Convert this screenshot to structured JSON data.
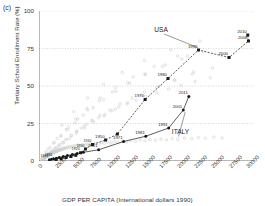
{
  "panel": {
    "tag": "(c)"
  },
  "chart_data": {
    "type": "scatter",
    "title": "",
    "xlabel": "GDP PER CAPITA (International dollars 1990)",
    "ylabel": "Tertiary School Enrollment Rate (%)",
    "xlim": [
      0,
      31000
    ],
    "ylim": [
      0,
      100
    ],
    "xticks": [
      0,
      2500,
      5000,
      7500,
      10000,
      12500,
      15000,
      17500,
      20000,
      22500,
      25000,
      27500,
      30000
    ],
    "yticks": [
      0,
      25,
      50,
      75,
      100
    ],
    "grid": "horizontal-dotted",
    "legend": "none",
    "annotations": [
      {
        "text": "USA",
        "x": 17600,
        "y": 86
      },
      {
        "text": "ITALY",
        "x": 20400,
        "y": 18
      }
    ],
    "background_points": {
      "name": "All countries (background scatter)",
      "marker": "open-circle",
      "color": "#c9c9c9",
      "x": [
        300,
        420,
        520,
        600,
        660,
        700,
        760,
        820,
        880,
        920,
        980,
        1020,
        1080,
        1140,
        1200,
        1260,
        1320,
        1380,
        1440,
        1500,
        1560,
        1620,
        1700,
        1760,
        1820,
        1900,
        1980,
        2050,
        2120,
        2200,
        2280,
        2360,
        2450,
        2540,
        2620,
        2700,
        2800,
        2900,
        3000,
        3100,
        3200,
        3300,
        3420,
        3520,
        3650,
        3800,
        3950,
        4100,
        4250,
        4400,
        4600,
        4800,
        5000,
        5200,
        5400,
        5600,
        5900,
        6200,
        6500,
        6800,
        7100,
        7400,
        7800,
        8200,
        8600,
        9000,
        9400,
        9900,
        10400,
        10900,
        11400,
        12000,
        12600,
        13200,
        13900,
        14600,
        15300,
        16000,
        16800,
        17600,
        18400,
        19200,
        20000,
        21000,
        22000,
        23000,
        24000,
        25200,
        26400,
        800,
        1100,
        1500,
        1900,
        2400,
        2900,
        3400,
        4000,
        4700,
        5400,
        6100,
        6900,
        7700,
        8600,
        9500,
        10500,
        11500,
        12700,
        14000,
        15400,
        17000,
        18700,
        20500,
        22500,
        24700,
        1200,
        1700,
        2300,
        3000,
        3800,
        4600,
        5500,
        6500,
        7600,
        8800,
        10200,
        11700,
        13400,
        15200,
        17300,
        19600,
        22100,
        25000,
        900,
        1400,
        2000,
        2700,
        3500,
        4400,
        5400,
        6600,
        7900,
        9400,
        11000,
        12800,
        14800,
        17000,
        19500,
        22300,
        1000,
        1600,
        2200,
        3100,
        4100,
        5200,
        6400,
        7800,
        9300,
        11100,
        13100,
        15300,
        17800,
        20600,
        23700,
        1300,
        2100,
        3200,
        4300,
        5600,
        7000,
        8700,
        10600,
        12800,
        15300,
        18200,
        21400,
        2600,
        3900,
        5300,
        6900,
        8800,
        11000,
        13600,
        16600,
        20000,
        3300,
        5000,
        7000,
        9300,
        12000,
        15200,
        19000,
        23200
      ],
      "y": [
        1.2,
        1.5,
        1.1,
        2.0,
        1.4,
        2.3,
        1.8,
        2.6,
        2.1,
        3.0,
        2.4,
        3.3,
        2.8,
        3.6,
        3.1,
        4.0,
        3.4,
        4.3,
        3.8,
        4.6,
        4.1,
        5.0,
        4.4,
        5.3,
        4.8,
        5.6,
        5.1,
        6.0,
        5.4,
        6.3,
        5.8,
        6.6,
        6.1,
        7.0,
        6.4,
        7.3,
        6.8,
        7.6,
        7.1,
        8.0,
        7.4,
        8.3,
        7.8,
        8.6,
        8.1,
        9.0,
        8.4,
        9.3,
        8.8,
        9.6,
        9.1,
        10.0,
        9.4,
        10.3,
        9.8,
        10.6,
        10.1,
        11.0,
        10.4,
        11.3,
        10.8,
        11.6,
        11.1,
        12.0,
        11.4,
        12.3,
        11.8,
        12.6,
        12.1,
        13.0,
        12.4,
        13.3,
        12.8,
        13.6,
        13.1,
        14.0,
        13.4,
        14.3,
        13.8,
        14.6,
        14.1,
        15.0,
        14.4,
        15.3,
        14.8,
        15.6,
        15.1,
        16.0,
        15.4,
        2.5,
        3.5,
        5.0,
        6.5,
        8.5,
        10.5,
        12.5,
        14.5,
        17.0,
        19.5,
        22.0,
        24.5,
        27.0,
        29.0,
        31.0,
        33.5,
        36.0,
        38.0,
        40.5,
        43.0,
        45.5,
        48.0,
        50.5,
        53.0,
        55.5,
        4.0,
        6.0,
        8.5,
        11.0,
        14.0,
        17.0,
        20.0,
        23.5,
        27.0,
        30.5,
        34.0,
        38.0,
        42.0,
        46.0,
        50.0,
        54.0,
        58.0,
        62.0,
        3.0,
        5.0,
        7.0,
        9.5,
        12.0,
        15.0,
        18.5,
        22.0,
        26.0,
        30.0,
        34.5,
        39.0,
        44.0,
        49.0,
        54.0,
        59.5,
        6.0,
        9.0,
        12.5,
        16.5,
        21.0,
        25.5,
        30.5,
        35.5,
        41.0,
        46.5,
        52.0,
        57.5,
        63.0,
        68.0,
        73.0,
        8.0,
        12.0,
        17.0,
        22.5,
        28.0,
        34.0,
        40.0,
        46.0,
        52.0,
        58.0,
        64.0,
        70.0,
        15.0,
        21.0,
        28.0,
        35.0,
        42.0,
        49.0,
        56.0,
        63.0,
        70.0,
        24.0,
        33.0,
        42.0,
        51.0,
        59.0,
        67.0,
        74.0,
        80.0
      ]
    },
    "series": [
      {
        "name": "USA",
        "marker": "filled-square",
        "line": "dashed",
        "color": "#1a1a1a",
        "points": [
          {
            "year": "1870",
            "x": 2450,
            "y": 1.0,
            "label": false
          },
          {
            "year": "1880",
            "x": 3200,
            "y": 1.6,
            "label": false
          },
          {
            "year": "1890",
            "x": 3900,
            "y": 2.3,
            "label": false
          },
          {
            "year": "1900",
            "x": 4600,
            "y": 3.0,
            "label": false
          },
          {
            "year": "1910",
            "x": 5300,
            "y": 3.8,
            "label": false
          },
          {
            "year": "1920",
            "x": 6000,
            "y": 5.5,
            "label": true
          },
          {
            "year": "1930",
            "x": 6700,
            "y": 8.0,
            "label": true
          },
          {
            "year": "1940",
            "x": 7700,
            "y": 11.0,
            "label": true
          },
          {
            "year": "1950",
            "x": 9600,
            "y": 14.0,
            "label": true
          },
          {
            "year": "1960",
            "x": 11300,
            "y": 18.0,
            "label": false
          },
          {
            "year": "1970",
            "x": 15300,
            "y": 41.0,
            "label": true
          },
          {
            "year": "1980",
            "x": 18600,
            "y": 55.0,
            "label": true
          },
          {
            "year": "1990",
            "x": 23000,
            "y": 74.0,
            "label": true
          },
          {
            "year": "2000",
            "x": 27400,
            "y": 69.0,
            "label": true
          },
          {
            "year": "2008",
            "x": 30200,
            "y": 80.0,
            "label": true
          },
          {
            "year": "2010",
            "x": 30100,
            "y": 84.0,
            "label": true
          }
        ]
      },
      {
        "name": "ITALY",
        "marker": "filled-circle",
        "line": "solid",
        "color": "#1a1a1a",
        "points": [
          {
            "year": "1861",
            "x": 1500,
            "y": 0.8,
            "label": true
          },
          {
            "year": "1871",
            "x": 1800,
            "y": 1.1,
            "label": false
          },
          {
            "year": "1881",
            "x": 2100,
            "y": 1.5,
            "label": true
          },
          {
            "year": "1891",
            "x": 2500,
            "y": 1.9,
            "label": false
          },
          {
            "year": "1901",
            "x": 2900,
            "y": 2.4,
            "label": false
          },
          {
            "year": "1911",
            "x": 3500,
            "y": 3.0,
            "label": false
          },
          {
            "year": "1921",
            "x": 4100,
            "y": 3.6,
            "label": false
          },
          {
            "year": "1931",
            "x": 4800,
            "y": 4.3,
            "label": false
          },
          {
            "year": "1941",
            "x": 5500,
            "y": 5.0,
            "label": false
          },
          {
            "year": "1951",
            "x": 6400,
            "y": 5.8,
            "label": false
          },
          {
            "year": "1961",
            "x": 8600,
            "y": 7.5,
            "label": true
          },
          {
            "year": "1971",
            "x": 12200,
            "y": 13.0,
            "label": true
          },
          {
            "year": "1981",
            "x": 15400,
            "y": 16.5,
            "label": true
          },
          {
            "year": "1991",
            "x": 18700,
            "y": 22.0,
            "label": true
          },
          {
            "year": "2001",
            "x": 20800,
            "y": 34.0,
            "label": true
          },
          {
            "year": "2011",
            "x": 21600,
            "y": 43.0,
            "label": true
          }
        ]
      }
    ]
  }
}
